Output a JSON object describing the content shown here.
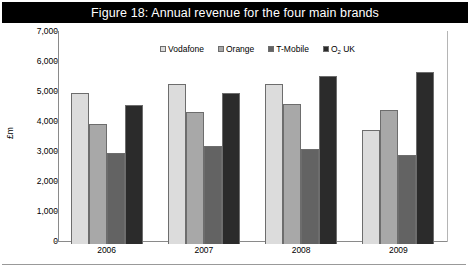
{
  "figure": {
    "title": "Figure 18: Annual revenue for the four main brands",
    "y_axis_title": "£m"
  },
  "legend": {
    "items": [
      {
        "label": "Vodafone",
        "color": "#dcdcdc"
      },
      {
        "label": "Orange",
        "color": "#a8a8a8"
      },
      {
        "label": "T-Mobile",
        "color": "#636363"
      },
      {
        "label_main": "O",
        "label_sub": "2",
        "label_tail": " UK",
        "color": "#2b2b2b"
      }
    ]
  },
  "axis": {
    "y_ticks": [
      "7,000",
      "6,000",
      "5,000",
      "4,000",
      "3,000",
      "2,000",
      "1,000",
      "0"
    ],
    "x_labels": [
      "2006",
      "2007",
      "2008",
      "2009"
    ]
  },
  "chart_data": {
    "type": "bar",
    "title": "Figure 18: Annual revenue for the four main brands",
    "xlabel": "",
    "ylabel": "£m",
    "ylim": [
      0,
      7000
    ],
    "ytick_interval": 1000,
    "grid": false,
    "legend_position": "top-center",
    "categories": [
      "2006",
      "2007",
      "2008",
      "2009"
    ],
    "series": [
      {
        "name": "Vodafone",
        "color": "#dcdcdc",
        "values": [
          5050,
          5350,
          5320,
          3800
        ]
      },
      {
        "name": "Orange",
        "color": "#a8a8a8",
        "values": [
          4000,
          4400,
          4670,
          4480
        ]
      },
      {
        "name": "T-Mobile",
        "color": "#636363",
        "values": [
          3030,
          3270,
          3180,
          2980
        ]
      },
      {
        "name": "O2 UK",
        "color": "#2b2b2b",
        "values": [
          4620,
          5030,
          5600,
          5750
        ]
      }
    ]
  }
}
